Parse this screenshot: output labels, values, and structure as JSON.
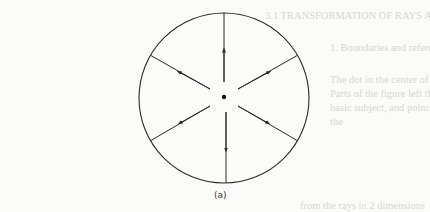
{
  "figure": {
    "caption": "(a)",
    "circle": {
      "cx": 224,
      "cy": 98,
      "r": 85
    },
    "center_dot": {
      "cx": 224,
      "cy": 97,
      "r": 2.2
    },
    "rays": [
      {
        "name": "up",
        "angle_deg": 90,
        "direction": "outward"
      },
      {
        "name": "upper-left",
        "angle_deg": 150,
        "direction": "outward"
      },
      {
        "name": "upper-right",
        "angle_deg": 30,
        "direction": "outward"
      },
      {
        "name": "lower-left",
        "angle_deg": 210,
        "direction": "outward"
      },
      {
        "name": "lower-right",
        "angle_deg": 330,
        "direction": "outward"
      },
      {
        "name": "down",
        "angle_deg": 270,
        "direction": "outward"
      }
    ],
    "stroke_color": "#2b2b2b"
  },
  "bleed_through_text": [
    "3.1   TRANSFORMATION OF RAYS AND WAVEFRONTS",
    "1.   Boundaries and reference wave",
    "The   dot in the center of the circle    on is shown",
    "Parts of the figure   left  the rays",
    "basic  subject, and   points",
    "   the",
    "from the  rays in 2 dimensions"
  ]
}
